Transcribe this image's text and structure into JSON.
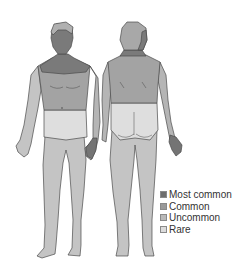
{
  "diagram": {
    "views": [
      {
        "name": "front",
        "label": "Front view"
      },
      {
        "name": "back",
        "label": "Back view"
      }
    ],
    "colors": {
      "most_common": "#6e6e6e",
      "common": "#9a9a9a",
      "uncommon": "#b9b9b9",
      "rare": "#dcdcdc",
      "outline": "#4a4a4a",
      "background": "#ffffff"
    }
  },
  "legend": {
    "items": [
      {
        "label": "Most common",
        "color": "#6e6e6e"
      },
      {
        "label": "Common",
        "color": "#9a9a9a"
      },
      {
        "label": "Uncommon",
        "color": "#b9b9b9"
      },
      {
        "label": "Rare",
        "color": "#dcdcdc"
      }
    ]
  }
}
